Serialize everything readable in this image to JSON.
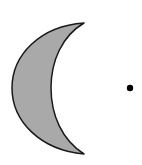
{
  "figure": {
    "crescent": {
      "fill": "#a9a9a9",
      "stroke": "#1a1a1a"
    },
    "dot": {
      "fill": "#000000"
    }
  }
}
